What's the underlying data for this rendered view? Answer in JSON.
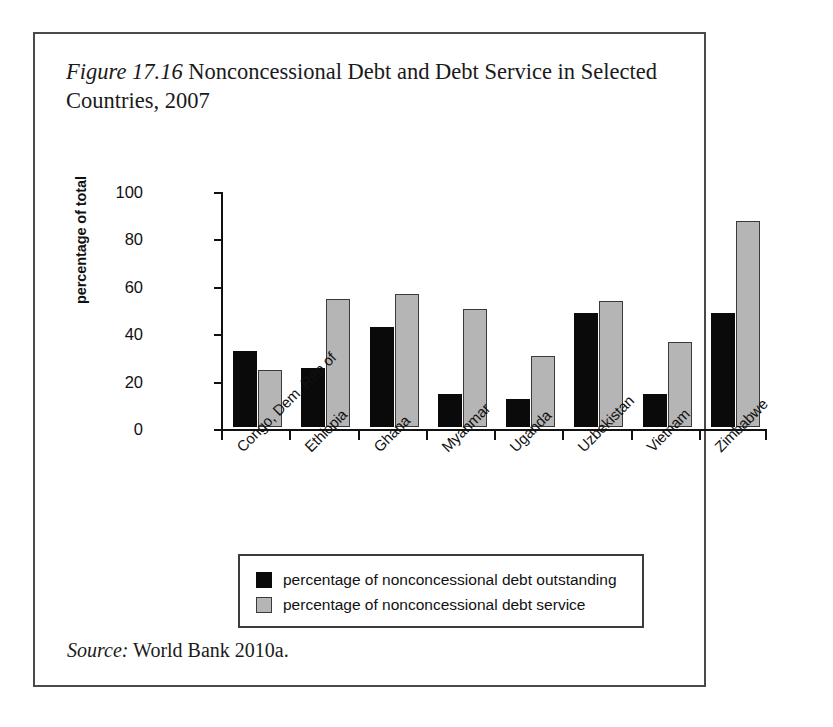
{
  "figure": {
    "label": "Figure 17.16",
    "title": "Nonconcessional Debt and Debt Service in Selected Countries, 2007",
    "source_label": "Source:",
    "source_text": "World Bank 2010a."
  },
  "legend": {
    "entries": [
      {
        "label": "percentage of nonconcessional debt outstanding",
        "color": "#0a0a0a",
        "swatch": "dark"
      },
      {
        "label": "percentage of nonconcessional debt service",
        "color": "#b5b5b5",
        "swatch": "light"
      }
    ]
  },
  "axis": {
    "y_label": "percentage of total",
    "y_ticks": [
      "0",
      "20",
      "40",
      "60",
      "80",
      "100"
    ]
  },
  "chart_data": {
    "type": "bar",
    "title": "Nonconcessional Debt and Debt Service in Selected Countries, 2007",
    "xlabel": "",
    "ylabel": "percentage of total",
    "ylim": [
      0,
      100
    ],
    "ytick_step": 20,
    "grid": false,
    "legend_position": "bottom",
    "categories": [
      "Congo, Dem. Rep of",
      "Ethiopia",
      "Ghana",
      "Myanmar",
      "Uganda",
      "Uzbekistan",
      "Vietnam",
      "Zimbabwe"
    ],
    "series": [
      {
        "name": "percentage of nonconcessional debt outstanding",
        "color": "#0a0a0a",
        "values": [
          32,
          25,
          42,
          14,
          12,
          48,
          14,
          48
        ]
      },
      {
        "name": "percentage of nonconcessional debt service",
        "color": "#b5b5b5",
        "values": [
          24,
          54,
          56,
          50,
          30,
          53,
          36,
          87
        ]
      }
    ]
  }
}
